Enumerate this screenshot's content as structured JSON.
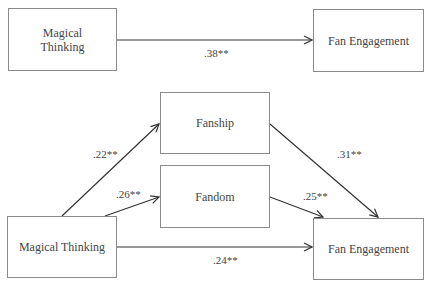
{
  "diagram": {
    "panel_a": {
      "nodes": {
        "predictor": "Magical Thinking",
        "outcome": "Fan Engagement"
      },
      "paths": {
        "total_effect": ".38**"
      }
    },
    "panel_b": {
      "nodes": {
        "predictor": "Magical Thinking",
        "mediator1": "Fanship",
        "mediator2": "Fandom",
        "outcome": "Fan Engagement"
      },
      "paths": {
        "mt_to_fanship": ".22**",
        "mt_to_fandom": ".26**",
        "fanship_to_fe": ".31**",
        "fandom_to_fe": ".25**",
        "direct_effect": ".24**"
      }
    }
  }
}
